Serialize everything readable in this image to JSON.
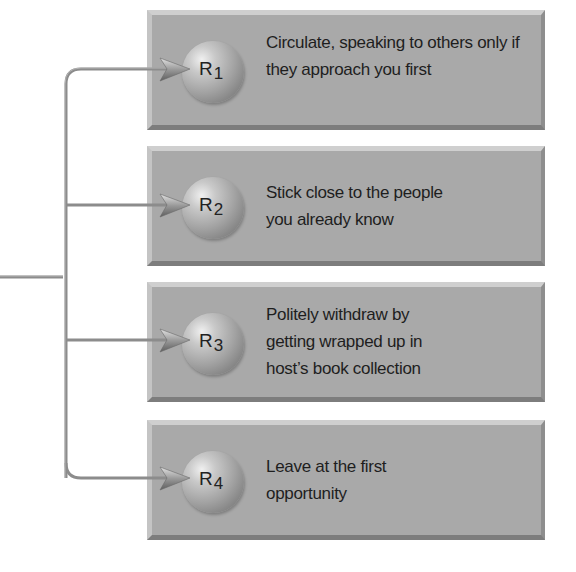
{
  "diagram": {
    "type": "branching-responses",
    "source_line": {
      "from": "left-edge",
      "to": "trunk"
    },
    "responses": [
      {
        "id": "R1",
        "symbol": "R",
        "subscript": "1",
        "text": "Circulate, speaking to others only if they approach you first"
      },
      {
        "id": "R2",
        "symbol": "R",
        "subscript": "2",
        "text": "Stick close to the people you already know"
      },
      {
        "id": "R3",
        "symbol": "R",
        "subscript": "3",
        "text": "Politely withdraw by getting wrapped up in host’s book collection"
      },
      {
        "id": "R4",
        "symbol": "R",
        "subscript": "4",
        "text": "Leave at the first opportunity"
      }
    ],
    "colors": {
      "box_fill": "#a9a9a9",
      "connector": "#8a8a8a",
      "text": "#1e1e1e"
    }
  }
}
